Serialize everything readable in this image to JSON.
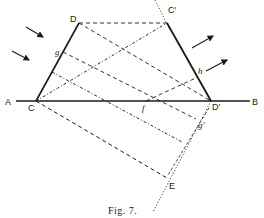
{
  "figure": {
    "caption": "Fig. 7.",
    "colors": {
      "ink": "#1a1a1a",
      "background": "#ffffff"
    }
  },
  "labels": {
    "A": "A",
    "B": "B",
    "C": "C",
    "D": "D",
    "C_prime": "C'",
    "D_prime": "D'",
    "E": "E",
    "f": "f",
    "g": "g",
    "g_prime": "g'",
    "h": "h"
  },
  "points": {
    "A": [
      16,
      101
    ],
    "B": [
      250,
      101
    ],
    "C": [
      36,
      101
    ],
    "D": [
      79,
      23
    ],
    "C_prime": [
      167,
      23
    ],
    "D_prime": [
      211,
      101
    ],
    "E": [
      167,
      178
    ],
    "f": [
      146,
      101
    ],
    "g": [
      63,
      52
    ],
    "g_prime": [
      196,
      119
    ],
    "h": [
      198,
      77
    ]
  },
  "icons": {
    "incident_arrows": "arrow-incident",
    "reflected_arrows": "arrow-refracted"
  }
}
